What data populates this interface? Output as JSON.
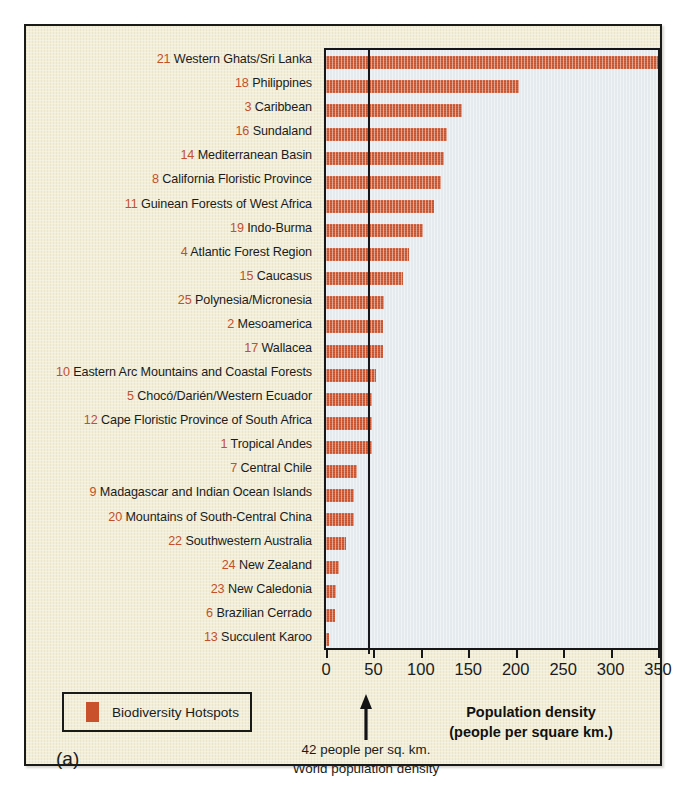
{
  "panel_label": "(a)",
  "legend": {
    "label": "Biodiversity Hotspots",
    "swatch_color": "#c9522c",
    "icon": "color-swatch-icon"
  },
  "axis": {
    "title_line1": "Population density",
    "title_line2": "(people per square km.)",
    "ticks": [
      "0",
      "50",
      "100",
      "150",
      "200",
      "250",
      "300",
      "350"
    ]
  },
  "annotation": {
    "arrow_icon": "up-arrow-icon",
    "line1": "42 people per sq. km.",
    "line2": "World population density",
    "value": 42
  },
  "colors": {
    "bar": "#c9522c",
    "plot_background": "#e5eaee",
    "figure_background": "#f2eed8",
    "rank_number": "#c1502b",
    "frame": "#17171a"
  },
  "chart_data": {
    "type": "bar",
    "orientation": "horizontal",
    "title": "",
    "xlabel": "Population density (people per square km.)",
    "ylabel": "",
    "xlim": [
      0,
      350
    ],
    "grid": false,
    "legend_position": "bottom-left",
    "reference_line": {
      "value": 42,
      "label": "World population density",
      "color": "#18181b"
    },
    "categories": [
      "Western Ghats/Sri Lanka",
      "Philippines",
      "Caribbean",
      "Sundaland",
      "Mediterranean Basin",
      "California Floristic Province",
      "Guinean Forests of West Africa",
      "Indo-Burma",
      "Atlantic Forest Region",
      "Caucasus",
      "Polynesia/Micronesia",
      "Mesoamerica",
      "Wallacea",
      "Eastern Arc Mountains and Coastal Forests",
      "Chocó/Darién/Western Ecuador",
      "Cape Floristic Province of South Africa",
      "Tropical Andes",
      "Central Chile",
      "Madagascar and Indian Ocean Islands",
      "Mountains of South-Central China",
      "Southwestern Australia",
      "New Zealand",
      "New Caledonia",
      "Brazilian Cerrado",
      "Succulent Karoo"
    ],
    "ranks": [
      21,
      18,
      3,
      16,
      14,
      8,
      11,
      19,
      4,
      15,
      25,
      2,
      17,
      10,
      5,
      12,
      1,
      7,
      9,
      20,
      22,
      24,
      23,
      6,
      13
    ],
    "values": [
      350,
      203,
      143,
      128,
      124,
      121,
      114,
      102,
      87,
      81,
      61,
      60,
      60,
      53,
      48,
      48,
      48,
      33,
      30,
      30,
      21,
      14,
      11,
      9,
      3
    ],
    "values_label": "Population density (people per square km.)"
  }
}
